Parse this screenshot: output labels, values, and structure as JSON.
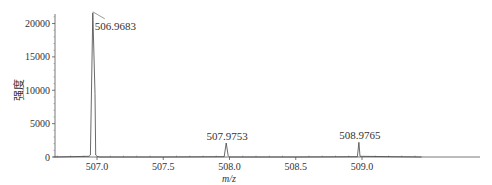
{
  "chart_data": {
    "type": "line",
    "title": "",
    "xlabel": "m/z",
    "ylabel": "强度",
    "xlim": [
      506.67,
      509.45
    ],
    "ylim": [
      0,
      21500
    ],
    "x_ticks": [
      507.0,
      507.5,
      508.0,
      508.5,
      509.0
    ],
    "x_tick_labels": [
      "507.0",
      "507.5",
      "508.0",
      "508.5",
      "509.0"
    ],
    "y_ticks": [
      0,
      5000,
      10000,
      15000,
      20000
    ],
    "y_tick_labels": [
      "0",
      "5000",
      "10000",
      "15000",
      "20000"
    ],
    "grid": false,
    "legend": null,
    "peaks": [
      {
        "mz": 506.9683,
        "intensity": 21600,
        "label": "506.9683"
      },
      {
        "mz": 507.9753,
        "intensity": 2100,
        "label": "507.9753"
      },
      {
        "mz": 508.9765,
        "intensity": 2200,
        "label": "508.9765"
      }
    ],
    "series": [
      {
        "name": "spectrum",
        "x": [
          506.67,
          506.94,
          506.95,
          506.9683,
          506.985,
          506.99,
          507.0,
          507.02,
          507.5,
          507.96,
          507.9753,
          507.99,
          508.0,
          508.5,
          508.965,
          508.9765,
          508.985,
          509.45
        ],
        "y": [
          0,
          100,
          300,
          21600,
          9500,
          300,
          100,
          0,
          0,
          50,
          2100,
          200,
          0,
          0,
          50,
          2200,
          100,
          0
        ]
      }
    ]
  }
}
